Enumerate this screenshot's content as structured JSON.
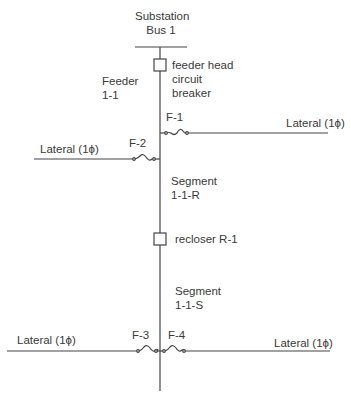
{
  "substation": {
    "line1": "Substation",
    "line2": "Bus 1"
  },
  "feeder": {
    "line1": "Feeder",
    "line2": "1-1"
  },
  "breaker": {
    "line1": "feeder head",
    "line2": "circuit",
    "line3": "breaker"
  },
  "fuses": {
    "f1": "F-1",
    "f2": "F-2",
    "f3": "F-3",
    "f4": "F-4"
  },
  "laterals": {
    "upper_left": "Lateral (1ϕ)",
    "upper_right": "Lateral (1ϕ)",
    "lower_left": "Lateral (1ϕ)",
    "lower_right": "Lateral (1ϕ)"
  },
  "segment_r": {
    "line1": "Segment",
    "line2": "1-1-R"
  },
  "recloser": "recloser R-1",
  "segment_s": {
    "line1": "Segment",
    "line2": "1-1-S"
  },
  "colors": {
    "line": "#444444",
    "text": "#3a3a3a",
    "background": "#ffffff"
  }
}
